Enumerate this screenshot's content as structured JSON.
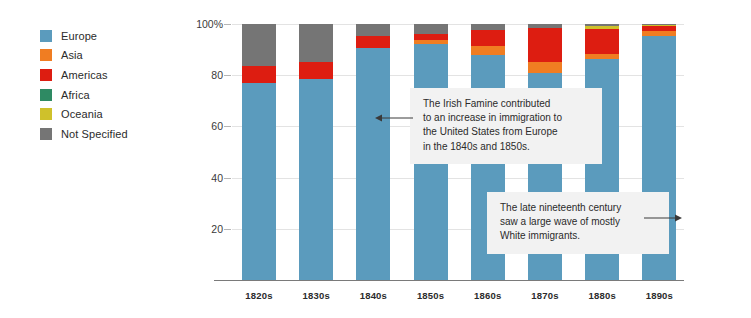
{
  "legend": {
    "items": [
      {
        "label": "Europe",
        "color": "#5b9bbd"
      },
      {
        "label": "Asia",
        "color": "#f07d22"
      },
      {
        "label": "Americas",
        "color": "#dd1d11"
      },
      {
        "label": "Africa",
        "color": "#2e8a63"
      },
      {
        "label": "Oceania",
        "color": "#cfc12b"
      },
      {
        "label": "Not Specified",
        "color": "#757575"
      }
    ]
  },
  "annotations": [
    {
      "id": "irish-famine-annotation",
      "text": "The Irish Famine contributed\nto an increase in immigration to\nthe United States from Europe\nin the 1840s and 1850s.",
      "arrow_direction": "left"
    },
    {
      "id": "late-nineteenth-century-annotation",
      "text": "The late nineteenth century\nsaw a large wave of mostly\nWhite immigrants.",
      "arrow_direction": "right"
    }
  ],
  "chart_data": {
    "type": "bar",
    "subtype": "stacked-100-percent",
    "title": "",
    "xlabel": "",
    "ylabel": "",
    "ylim": [
      0,
      100
    ],
    "yticks": [
      20,
      40,
      60,
      80,
      100
    ],
    "ytick_labels": [
      "20",
      "40",
      "60",
      "80",
      "100%"
    ],
    "grid": true,
    "legend_position": "top-left",
    "categories": [
      "1820s",
      "1830s",
      "1840s",
      "1850s",
      "1860s",
      "1870s",
      "1880s",
      "1890s"
    ],
    "series": [
      {
        "name": "Europe",
        "color": "#5b9bbd",
        "values": [
          77.0,
          78.5,
          90.5,
          92.0,
          88.0,
          81.0,
          86.5,
          95.5
        ]
      },
      {
        "name": "Asia",
        "color": "#f07d22",
        "values": [
          0.0,
          0.0,
          0.0,
          1.6,
          3.3,
          4.3,
          1.6,
          1.8
        ]
      },
      {
        "name": "Americas",
        "color": "#dd1d11",
        "values": [
          6.5,
          6.5,
          5.0,
          2.4,
          6.5,
          13.0,
          10.0,
          2.0
        ]
      },
      {
        "name": "Africa",
        "color": "#2e8a63",
        "values": [
          0.0,
          0.0,
          0.0,
          0.0,
          0.0,
          0.0,
          0.0,
          0.0
        ]
      },
      {
        "name": "Oceania",
        "color": "#cfc12b",
        "values": [
          0.0,
          0.0,
          0.0,
          0.0,
          0.0,
          0.0,
          1.0,
          0.2
        ]
      },
      {
        "name": "Not Specified",
        "color": "#757575",
        "values": [
          16.5,
          15.0,
          4.5,
          4.0,
          2.2,
          1.7,
          0.9,
          0.5
        ]
      }
    ]
  }
}
